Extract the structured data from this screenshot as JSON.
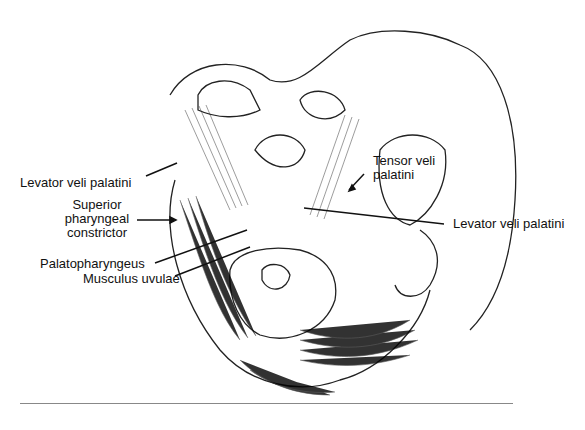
{
  "figure": {
    "labels": {
      "levator_left": "Levator veli palatini",
      "superior_constrictor_1": "Superior",
      "superior_constrictor_2": "pharyngeal",
      "superior_constrictor_3": "constrictor",
      "palatopharyngeus": "Palatopharyngeus",
      "musculus_uvulae": "Musculus uvulae",
      "tensor_1": "Tensor veli",
      "tensor_2": "palatini",
      "levator_right": "Levator veli palatini"
    }
  }
}
